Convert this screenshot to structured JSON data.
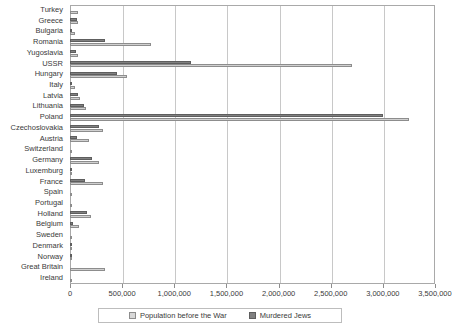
{
  "chart_data": {
    "type": "bar",
    "orientation": "horizontal",
    "title": "",
    "xlabel": "",
    "ylabel": "",
    "xlim": [
      0,
      3500000
    ],
    "xticks": [
      0,
      500000,
      1000000,
      1500000,
      2000000,
      2500000,
      3000000,
      3500000
    ],
    "xticklabels": [
      "0",
      "500,000",
      "1,000,000",
      "1,500,000",
      "2,000,000",
      "2,500,000",
      "3,000,000",
      "3,500,000"
    ],
    "grid": true,
    "legend_position": "bottom",
    "categories": [
      "Turkey",
      "Greece",
      "Bulgaria",
      "Romania",
      "Yugoslavia",
      "USSR",
      "Hungary",
      "Italy",
      "Latvia",
      "Lithuania",
      "Poland",
      "Czechoslovakia",
      "Austria",
      "Switzerland",
      "Germany",
      "Luxemburg",
      "France",
      "Spain",
      "Portugal",
      "Holland",
      "Belgium",
      "Sweden",
      "Denmark",
      "Norway",
      "Great Britain",
      "Ireland"
    ],
    "series": [
      {
        "name": "Population before the War",
        "color": "#d0d0d0",
        "values": [
          80000,
          77000,
          50000,
          780000,
          78000,
          2700000,
          545000,
          48000,
          95000,
          155000,
          3250000,
          315000,
          185000,
          18000,
          280000,
          5000,
          315000,
          6000,
          3000,
          200000,
          90000,
          8000,
          8000,
          2000,
          340000,
          4000
        ]
      },
      {
        "name": "Murdered Jews",
        "color": "#808080",
        "values": [
          0,
          65000,
          7000,
          340000,
          60000,
          1160000,
          450000,
          8000,
          80000,
          135000,
          3000000,
          277000,
          65000,
          0,
          210000,
          1000,
          140000,
          0,
          0,
          160000,
          28000,
          0,
          1000,
          1000,
          0,
          0
        ]
      }
    ]
  },
  "legend": {
    "items": [
      {
        "label": "Population before the War",
        "icon": "legend-swatch-light"
      },
      {
        "label": "Murdered Jews",
        "icon": "legend-swatch-dark"
      }
    ]
  }
}
